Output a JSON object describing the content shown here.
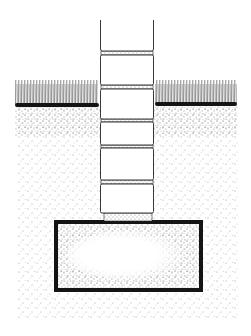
{
  "diagram": {
    "caption": "",
    "colors": {
      "background": "#ffffff",
      "ink": "#141414",
      "stipple": "#3a3a3a",
      "block_fill": "#ffffff"
    },
    "elements": {
      "wall": {
        "x": 100,
        "width": 54,
        "top": 20
      },
      "blocks": [
        {
          "y": 20,
          "h": 31
        },
        {
          "y": 55,
          "h": 30
        },
        {
          "y": 89,
          "h": 30
        },
        {
          "y": 122,
          "h": 23
        },
        {
          "y": 148,
          "h": 32
        },
        {
          "y": 184,
          "h": 29
        }
      ],
      "mortar_joints": [
        {
          "y": 51,
          "h": 4
        },
        {
          "y": 85,
          "h": 4
        },
        {
          "y": 119,
          "h": 3
        },
        {
          "y": 145,
          "h": 3
        },
        {
          "y": 180,
          "h": 4
        },
        {
          "y": 213,
          "h": 8
        }
      ],
      "grass_left": {
        "x1": 15,
        "x2": 98,
        "top": 78,
        "ground": 105
      },
      "grass_right": {
        "x1": 155,
        "x2": 237,
        "top": 80,
        "ground": 104
      },
      "topsoil": {
        "y1": 106,
        "y2": 136
      },
      "soil": {
        "x1": 18,
        "x2": 238,
        "y1": 106,
        "y2": 318
      },
      "footing": {
        "x": 54,
        "y": 220,
        "width": 149,
        "height": 72,
        "border": 4
      }
    }
  }
}
